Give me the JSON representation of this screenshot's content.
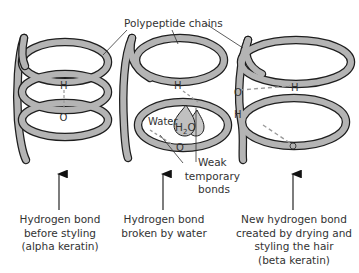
{
  "diagram": {
    "top_label": "Polypeptide chains",
    "colors": {
      "chain_fill": "#b4b4b4",
      "chain_outline": "#1e1e1e",
      "bond_dash": "#9a9a9a",
      "text": "#333333",
      "water_drop": "#c0c0c0"
    },
    "panels": [
      {
        "id": "alpha",
        "atoms": {
          "h": "H",
          "o": "O"
        },
        "caption": [
          "Hydrogen bond",
          "before styling",
          "(alpha keratin)"
        ]
      },
      {
        "id": "broken",
        "atoms": {
          "h": "H",
          "o": "O"
        },
        "water_label": "Water",
        "water_formula": "H",
        "water_subscript": "2",
        "water_formula_o": "O",
        "weak_bonds_label": [
          "Weak",
          "temporary",
          "bonds"
        ],
        "caption": [
          "Hydrogen bond",
          "broken by water"
        ]
      },
      {
        "id": "beta",
        "atoms": {
          "o1": "O",
          "h1": "H",
          "h2": "H",
          "o2": "O"
        },
        "caption": [
          "New hydrogen bond",
          "created by drying and",
          "styling the hair",
          "(beta keratin)"
        ]
      }
    ]
  }
}
